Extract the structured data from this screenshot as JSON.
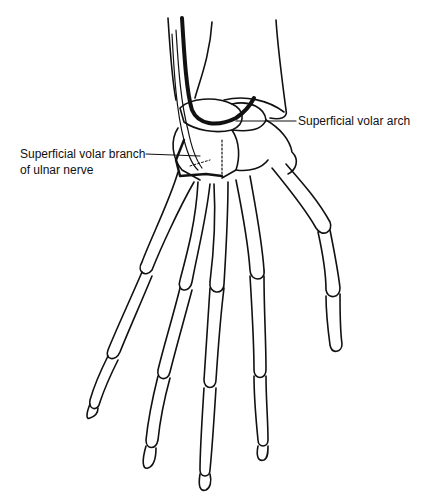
{
  "diagram": {
    "labels": [
      {
        "id": "arch",
        "text": "Superficial volar arch"
      },
      {
        "id": "nerve_line1",
        "text": "Superficial volar branch"
      },
      {
        "id": "nerve_line2",
        "text": "of ulnar nerve"
      }
    ],
    "colors": {
      "line": "#111111",
      "background": "#ffffff"
    }
  }
}
